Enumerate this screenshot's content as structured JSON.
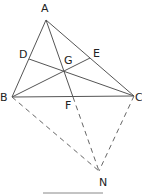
{
  "diagram": {
    "points": {
      "A": {
        "label": "A",
        "x": 46,
        "y": 20
      },
      "B": {
        "label": "B",
        "x": 12,
        "y": 97
      },
      "C": {
        "label": "C",
        "x": 134,
        "y": 96
      },
      "D": {
        "label": "D",
        "x": 29,
        "y": 59
      },
      "E": {
        "label": "E",
        "x": 90,
        "y": 58
      },
      "F": {
        "label": "F",
        "x": 73,
        "y": 97
      },
      "G": {
        "label": "G",
        "x": 64,
        "y": 70
      },
      "N": {
        "label": "N",
        "x": 99,
        "y": 171
      }
    },
    "solid_segments": [
      "AB",
      "AC",
      "BC",
      "AF",
      "BE",
      "CD"
    ],
    "dashed_segments": [
      "BN",
      "FN",
      "CN"
    ],
    "labels": {
      "A": "A",
      "B": "B",
      "C": "C",
      "D": "D",
      "E": "E",
      "F": "F",
      "G": "G",
      "N": "N"
    }
  }
}
